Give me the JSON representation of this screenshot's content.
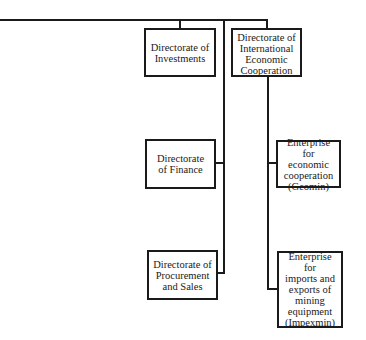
{
  "diagram": {
    "type": "org-chart",
    "colors": {
      "line": "#1a1a1a",
      "background": "#ffffff"
    },
    "nodes": {
      "investments": {
        "label": "Directorate of Investments",
        "lines": [
          "Directorate of",
          "Investments"
        ]
      },
      "intl_coop": {
        "label": "Directorate of International Economic Cooperation",
        "lines": [
          "Directorate of",
          "International",
          "Economic",
          "Cooperation"
        ]
      },
      "finance": {
        "label": "Directorate of Finance",
        "lines": [
          "Directorate",
          "of Finance"
        ]
      },
      "procurement": {
        "label": "Directorate of Procurement and Sales",
        "lines": [
          "Directorate of",
          "Procurement",
          "and Sales"
        ]
      },
      "geomin": {
        "label": "Enterprise for economic cooperation (Geomin)",
        "lines": [
          "Enterprise for",
          "economic",
          "cooperation",
          "(Geomin)"
        ]
      },
      "impexmin": {
        "label": "Enterprise for imports and exports of mining equipment (Impexmin)",
        "lines": [
          "Enterprise for",
          "imports and",
          "exports of",
          "mining",
          "equipment",
          "(Impexmin)"
        ]
      }
    },
    "edges": [
      [
        "parent",
        "investments"
      ],
      [
        "parent",
        "intl_coop"
      ],
      [
        "parent",
        "finance"
      ],
      [
        "parent",
        "procurement"
      ],
      [
        "intl_coop",
        "geomin"
      ],
      [
        "intl_coop",
        "impexmin"
      ]
    ]
  }
}
